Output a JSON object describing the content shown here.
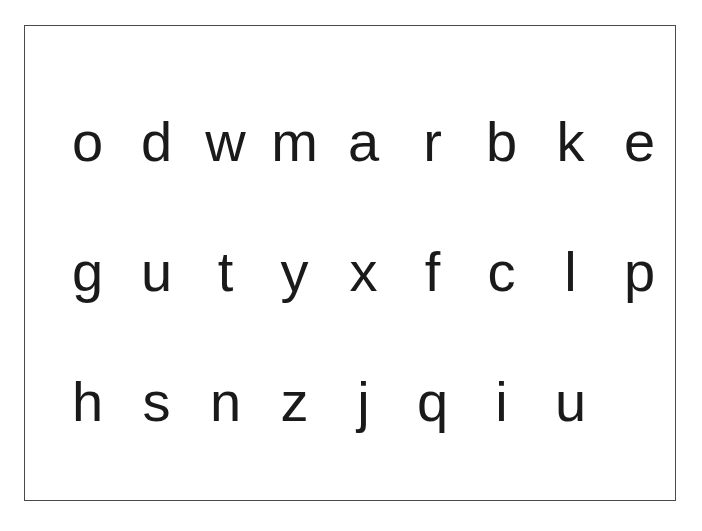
{
  "page": {
    "background_color": "#ffffff",
    "frame_border_color": "#4a4a4a",
    "text_color": "#1a1a1a"
  },
  "letter_grid": {
    "rows": [
      {
        "index": 1,
        "letters": [
          "o",
          "d",
          "w",
          "m",
          "a",
          "r",
          "b",
          "k",
          "e"
        ]
      },
      {
        "index": 2,
        "letters": [
          "g",
          "u",
          "t",
          "y",
          "x",
          "f",
          "c",
          "l",
          "p"
        ]
      },
      {
        "index": 3,
        "letters": [
          "h",
          "s",
          "n",
          "z",
          "j",
          "q",
          "i",
          "u"
        ]
      }
    ]
  }
}
